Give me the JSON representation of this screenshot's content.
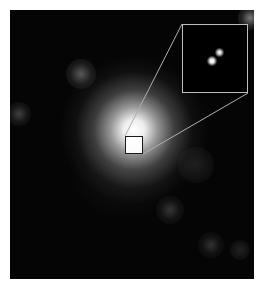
{
  "image": {
    "description": "Astronomical image of a bright central point source with a magnified inset revealing two close point sources",
    "background_color": "#050505",
    "frame": {
      "x": 10,
      "y": 10,
      "width": 244,
      "height": 269
    }
  },
  "central_source": {
    "cx": 134,
    "cy": 145,
    "label": "bright central source"
  },
  "zoom_box": {
    "x": 125,
    "y": 136,
    "width": 18,
    "height": 18,
    "border_color": "#1a1a1a"
  },
  "inset": {
    "x": 182,
    "y": 24,
    "width": 66,
    "height": 69,
    "border_color": "#bdbdbd",
    "sources": [
      {
        "name": "source-a",
        "x_pct": 45,
        "y_pct": 55
      },
      {
        "name": "source-b",
        "x_pct": 56,
        "y_pct": 41
      }
    ]
  },
  "faint_sources": [
    {
      "x": 81,
      "y": 74,
      "r": 15
    },
    {
      "x": 19,
      "y": 114,
      "r": 12
    },
    {
      "x": 170,
      "y": 210,
      "r": 14
    },
    {
      "x": 211,
      "y": 245,
      "r": 13
    },
    {
      "x": 240,
      "y": 250,
      "r": 10
    },
    {
      "x": 250,
      "y": 18,
      "r": 12
    },
    {
      "x": 196,
      "y": 165,
      "r": 18
    }
  ]
}
